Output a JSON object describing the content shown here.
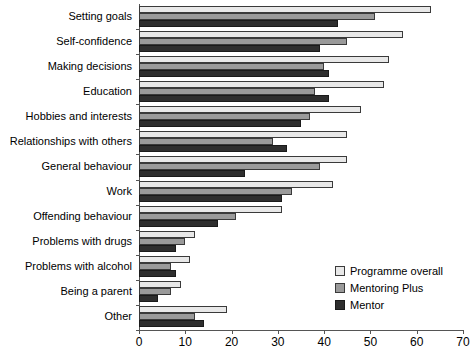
{
  "chart_data": {
    "type": "bar",
    "orientation": "horizontal",
    "title": "",
    "subtitle": "",
    "xlabel": "",
    "ylabel": "",
    "xlim": [
      0,
      70
    ],
    "xticks": [
      0,
      10,
      20,
      30,
      40,
      50,
      60,
      70
    ],
    "grid": false,
    "legend_position": "bottom-right",
    "categories": [
      "Setting goals",
      "Self-confidence",
      "Making decisions",
      "Education",
      "Hobbies and interests",
      "Relationships with others",
      "General behaviour",
      "Work",
      "Offending behaviour",
      "Problems with drugs",
      "Problems with alcohol",
      "Being a parent",
      "Other"
    ],
    "series": [
      {
        "name": "Programme overall",
        "color": "#e8e8e8",
        "values": [
          63,
          57,
          54,
          53,
          48,
          45,
          45,
          42,
          31,
          12,
          11,
          9,
          19
        ]
      },
      {
        "name": "Mentoring Plus",
        "color": "#9a9a9a",
        "values": [
          51,
          45,
          40,
          38,
          37,
          29,
          39,
          33,
          21,
          10,
          7,
          7,
          12
        ]
      },
      {
        "name": "Mentor",
        "color": "#2e2e2e",
        "values": [
          43,
          39,
          41,
          41,
          35,
          32,
          23,
          31,
          17,
          8,
          8,
          4,
          14
        ]
      }
    ]
  },
  "legend": {
    "items": [
      {
        "label": "Programme overall",
        "swatch": "s0"
      },
      {
        "label": "Mentoring Plus",
        "swatch": "s1"
      },
      {
        "label": "Mentor",
        "swatch": "s2"
      }
    ]
  },
  "axis": {
    "value_tick_labels": [
      "0",
      "10",
      "20",
      "30",
      "40",
      "50",
      "60",
      "70"
    ]
  }
}
